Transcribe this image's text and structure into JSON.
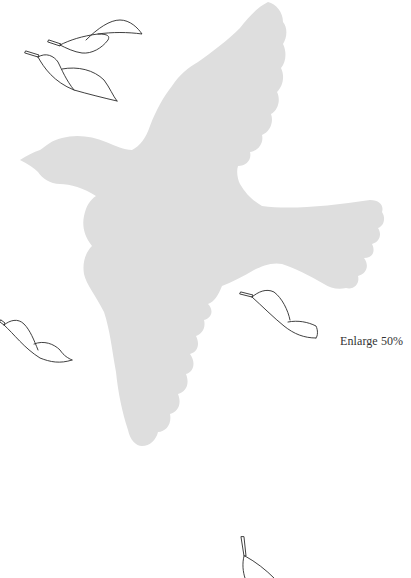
{
  "template": {
    "instruction_label": "Enlarge 50%",
    "colors": {
      "background": "#ffffff",
      "bird_fill": "#dedede",
      "leaf_stroke": "#2a2a2a",
      "text": "#333333"
    },
    "shapes": {
      "bird": "bird-silhouette",
      "leaves": [
        "leaf-top-upper",
        "leaf-top-lower",
        "leaf-left-middle",
        "leaf-right-middle",
        "leaf-bottom-partial"
      ]
    }
  }
}
